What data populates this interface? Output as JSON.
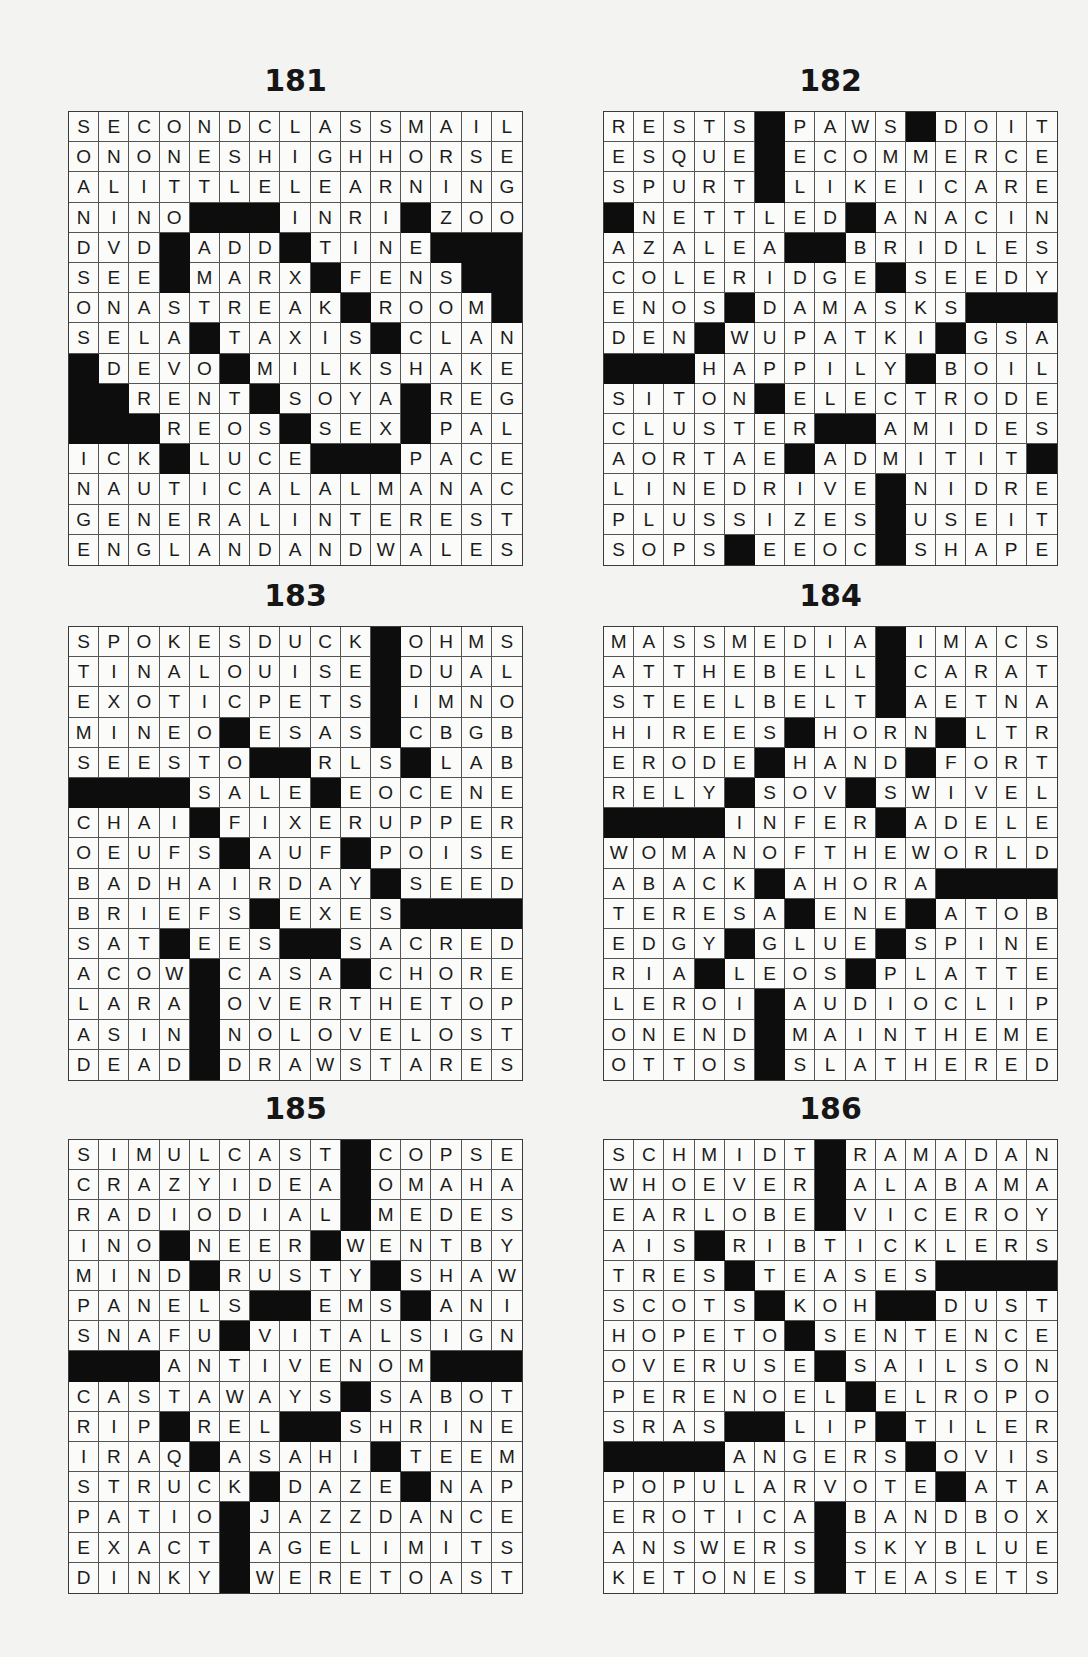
{
  "page": {
    "block_char": "#",
    "colors": {
      "paper": "#f3f3f1",
      "block": "#0d0d0d",
      "grid_line": "#555555",
      "text": "#1b1b1b"
    }
  },
  "puzzles": [
    {
      "number": "181",
      "rows": [
        "SECONDCLASSMAIL",
        "ONONESHIGHHORSE",
        "ALITTLELEARNING",
        "NINO###INRI#ZOO",
        "DVD#ADD#TINE###",
        "SEE#MARX#FENS##",
        "ONASTREAK#ROOM#",
        "SELA#TAXIS#CLAN",
        "#DEVO#MILKSHAKE",
        "##RENT#SOYA#REG",
        "###REOS#SEX#PAL",
        "ICK#LUCE###PACE",
        "NAUTICALALMANAC",
        "GENERALINTEREST",
        "ENGLANDANDWALES"
      ]
    },
    {
      "number": "182",
      "rows": [
        "RESTS#PAWS#DOIT",
        "ESQUE#ECOMMERCE",
        "SPURT#LIKEICARE",
        "#NETTLED#ANACIN",
        "AZALEA##BRIDLES",
        "COLERIDGE#SEEDY",
        "ENOS#DAMASKS###",
        "DEN#WUPATKI#GSA",
        "###HAPPILY#BOIL",
        "SITON#ELECTRODE",
        "CLUSTER##AMIDES",
        "AORTAE#ADMITIT#",
        "LINEDRIVE#NIDRE",
        "PLUSSIZES#USEIT",
        "SOPS#EEOC#SHAPE"
      ]
    },
    {
      "number": "183",
      "rows": [
        "SPOKESDUCK#OHMS",
        "TINALOUISE#DUAL",
        "EXOTICPETS#IMNO",
        "MINEO#ESAS#CBGB",
        "SEESTO##RLS#LAB",
        "####SALE#EOCENE",
        "CHAI#FIXERUPPER",
        "OEUFS#AUF#POISE",
        "BADHAIRDAY#SEED",
        "BRIEFS#EXES####",
        "SAT#EES##SACRED",
        "ACOW#CASA#CHORE",
        "LARA#OVERTHETOP",
        "ASIN#NOLOVELOST",
        "DEAD#DRAWSTARES"
      ]
    },
    {
      "number": "184",
      "rows": [
        "MASSMEDIA#IMACS",
        "ATTHEBELL#CARAT",
        "STEELBELT#AETNA",
        "HIREES#HORN#LTR",
        "ERODE#HAND#FORT",
        "RELY#SOV#SWIVEL",
        "####INFER#ADELE",
        "WOMANOFTHEWORLD",
        "ABACK#AHORA####",
        "TERESA#ENE#ATOB",
        "EDGY#GLUE#SPINE",
        "RIA#LEOS#PLATTE",
        "LEROI#AUDIOCLIP",
        "ONEND#MAINTHEME",
        "OTTOS#SLATHERED"
      ]
    },
    {
      "number": "185",
      "rows": [
        "SIMULCAST#COPSE",
        "CRAZYIDEA#OMAHA",
        "RADIODIAL#MEDES",
        "INO#NEER#WENTBY",
        "MIND#RUSTY#SHAW",
        "PANELS##EMS#ANI",
        "SNAFU#VITALSIGN",
        "###ANTIVENOM###",
        "CASTAWAYS#SABOT",
        "RIP#REL##SHRINE",
        "IRAQ#ASAHI#TEEM",
        "STRUCK#DAZE#NAP",
        "PATIO#JAZZDANCE",
        "EXACT#AGELIMITS",
        "DINKY#WERETOAST"
      ]
    },
    {
      "number": "186",
      "rows": [
        "SCHMIDT#RAMADAN",
        "WHOEVER#ALABAMA",
        "EARLOBE#VICEROY",
        "AIS#RIBTICKLERS",
        "TRES#TEASES####",
        "SCOTS#KOH##DUST",
        "HOPETO#SENTENCE",
        "OVERUSE#SAILSON",
        "PERENOEL#ELROPO",
        "SRAS##LIP#TILER",
        "####ANGERS#OVIS",
        "POPULARVOTE#ATA",
        "EROTICA#BANDBOX",
        "ANSWERS#SKYBLUE",
        "KETONES#TEASETS"
      ]
    }
  ]
}
